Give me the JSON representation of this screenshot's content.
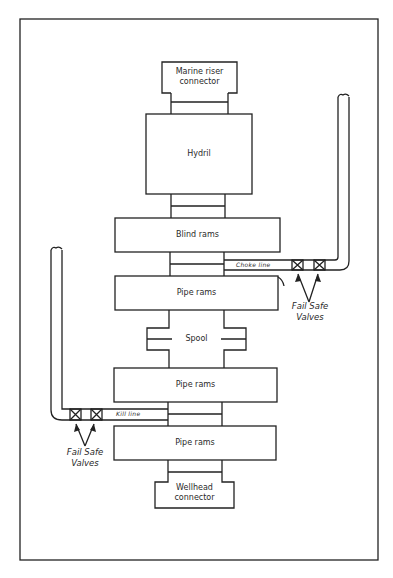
{
  "diagram": {
    "type": "blowout-preventer-stack",
    "colors": {
      "line": "#222222",
      "background": "#ffffff"
    },
    "components": {
      "marine_riser_connector": "Marine riser\nconnector",
      "marine_riser_line1": "Marine riser",
      "marine_riser_line2": "connector",
      "hydril": "Hydril",
      "blind_rams": "Blind rams",
      "pipe_rams_1": "Pipe rams",
      "spool": "Spool",
      "pipe_rams_2": "Pipe rams",
      "pipe_rams_3": "Pipe rams",
      "wellhead_line1": "Wellhead",
      "wellhead_line2": "connector"
    },
    "lines": {
      "choke_line": "Choke line",
      "kill_line": "Kill line"
    },
    "valves": {
      "choke_valves_line1": "Fail Safe",
      "choke_valves_line2": "Valves",
      "kill_valves_line1": "Fail Safe",
      "kill_valves_line2": "Valves"
    }
  }
}
